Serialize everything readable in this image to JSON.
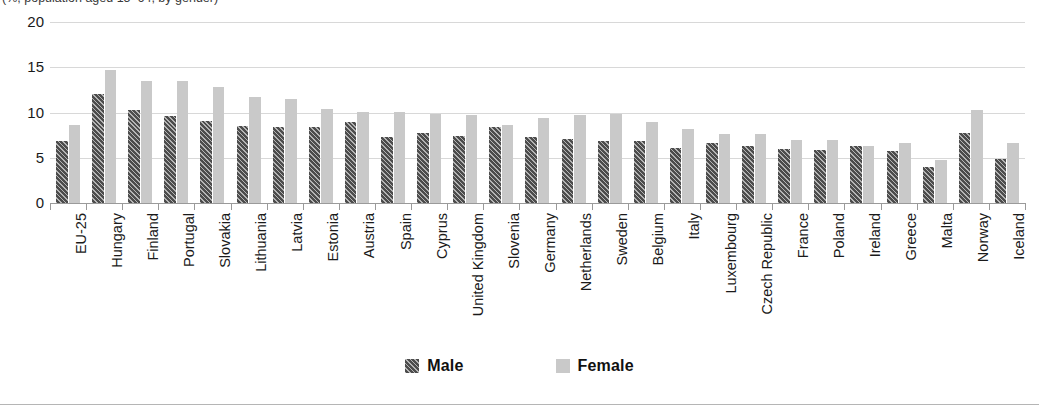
{
  "title_clipped": "(%, population aged 15–64, by gender)",
  "legend": {
    "position": "bottom-center",
    "entries": [
      {
        "name": "Male",
        "color": "#4c4c4c",
        "pattern": "diagonal-hatch"
      },
      {
        "name": "Female",
        "color": "#c9c9c9",
        "pattern": "solid"
      }
    ]
  },
  "colors": {
    "male": "#4c4c4c",
    "female": "#c9c9c9",
    "gridline": "#d8d8d8",
    "axis": "#9a9a9a",
    "text": "#1a1a1a",
    "background": "#ffffff"
  },
  "chart_data": {
    "type": "bar",
    "title": "",
    "xlabel": "",
    "ylabel": "",
    "ylim": [
      0,
      20
    ],
    "yticks": [
      0,
      5,
      10,
      15,
      20
    ],
    "ytick_labels": [
      "0",
      "5",
      "10",
      "15",
      "20"
    ],
    "grid": true,
    "legend_position": "bottom-center",
    "categories": [
      "EU-25",
      "Hungary",
      "Finland",
      "Portugal",
      "Slovakia",
      "Lithuania",
      "Latvia",
      "Estonia",
      "Austria",
      "Spain",
      "Cyprus",
      "United Kingdom",
      "Slovenia",
      "Germany",
      "Netherlands",
      "Sweden",
      "Belgium",
      "Italy",
      "Luxembourg",
      "Czech Republic",
      "France",
      "Poland",
      "Ireland",
      "Greece",
      "Malta",
      "Norway",
      "Iceland"
    ],
    "series": [
      {
        "name": "Male",
        "color": "#4c4c4c",
        "values": [
          6.8,
          12.0,
          10.3,
          9.6,
          9.1,
          8.5,
          8.4,
          8.4,
          8.9,
          7.3,
          7.7,
          7.4,
          8.4,
          7.3,
          7.1,
          6.9,
          6.8,
          6.1,
          6.6,
          6.3,
          6.0,
          5.9,
          6.3,
          5.8,
          4.0,
          7.7,
          4.9
        ]
      },
      {
        "name": "Female",
        "color": "#c9c9c9",
        "values": [
          8.6,
          14.7,
          13.5,
          13.5,
          12.8,
          11.7,
          11.5,
          10.4,
          10.1,
          10.1,
          9.8,
          9.7,
          8.6,
          9.4,
          9.7,
          9.8,
          9.0,
          8.2,
          7.6,
          7.6,
          7.0,
          7.0,
          6.3,
          6.6,
          4.7,
          10.3,
          6.6
        ]
      }
    ]
  }
}
